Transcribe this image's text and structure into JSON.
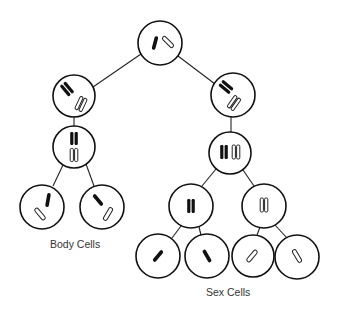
{
  "diagram": {
    "type": "cell-division-tree",
    "labels": {
      "body_cells": "Body Cells",
      "sex_cells": "Sex Cells"
    },
    "colors": {
      "outline": "#111111",
      "dark_chromosome": "#111111",
      "light_chromosome": "#ffffff",
      "background": "#ffffff"
    },
    "nodes": [
      {
        "id": "parent",
        "cx": 160,
        "cy": 43,
        "r": 22,
        "content": "one dark + one light chromosome"
      },
      {
        "id": "mitosis-1",
        "cx": 74,
        "cy": 96,
        "r": 21,
        "content": "duplicated dark + duplicated light"
      },
      {
        "id": "mitosis-2",
        "cx": 74,
        "cy": 147,
        "r": 21,
        "content": "duplicated pairs aligned vertically"
      },
      {
        "id": "body-cell-1",
        "cx": 42,
        "cy": 207,
        "r": 22,
        "content": "one dark + one light"
      },
      {
        "id": "body-cell-2",
        "cx": 102,
        "cy": 207,
        "r": 22,
        "content": "one dark + one light"
      },
      {
        "id": "meiosis-1",
        "cx": 233,
        "cy": 95,
        "r": 22,
        "content": "duplicated dark + duplicated light"
      },
      {
        "id": "meiosis-2",
        "cx": 230,
        "cy": 153,
        "r": 21,
        "content": "duplicated pairs side by side"
      },
      {
        "id": "meiosis-3a",
        "cx": 191,
        "cy": 206,
        "r": 22,
        "content": "duplicated dark"
      },
      {
        "id": "meiosis-3b",
        "cx": 264,
        "cy": 206,
        "r": 22,
        "content": "duplicated light"
      },
      {
        "id": "sex-cell-1",
        "cx": 158,
        "cy": 256,
        "r": 22,
        "content": "single dark"
      },
      {
        "id": "sex-cell-2",
        "cx": 207,
        "cy": 256,
        "r": 22,
        "content": "single dark"
      },
      {
        "id": "sex-cell-3",
        "cx": 253,
        "cy": 256,
        "r": 21,
        "content": "single light"
      },
      {
        "id": "sex-cell-4",
        "cx": 297,
        "cy": 257,
        "r": 22,
        "content": "single light"
      }
    ],
    "edges": [
      [
        "parent",
        "mitosis-1"
      ],
      [
        "parent",
        "meiosis-1"
      ],
      [
        "mitosis-1",
        "mitosis-2"
      ],
      [
        "mitosis-2",
        "body-cell-1"
      ],
      [
        "mitosis-2",
        "body-cell-2"
      ],
      [
        "meiosis-1",
        "meiosis-2"
      ],
      [
        "meiosis-2",
        "meiosis-3a"
      ],
      [
        "meiosis-2",
        "meiosis-3b"
      ],
      [
        "meiosis-3a",
        "sex-cell-1"
      ],
      [
        "meiosis-3a",
        "sex-cell-2"
      ],
      [
        "meiosis-3b",
        "sex-cell-3"
      ],
      [
        "meiosis-3b",
        "sex-cell-4"
      ]
    ]
  }
}
